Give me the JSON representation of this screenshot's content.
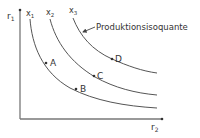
{
  "diagram": {
    "title": "Produktionsisoquante",
    "axes": {
      "y_label": "r",
      "y_sub": "1",
      "x_label": "r",
      "x_sub": "2"
    },
    "curves": [
      {
        "label": "x",
        "sub": "1"
      },
      {
        "label": "x",
        "sub": "2"
      },
      {
        "label": "x",
        "sub": "3"
      }
    ],
    "points": [
      {
        "label": "A",
        "curve": "x1"
      },
      {
        "label": "B",
        "curve": "x1"
      },
      {
        "label": "C",
        "curve": "x2"
      },
      {
        "label": "D",
        "curve": "x3"
      }
    ],
    "annotation": "Produktionsisoquante",
    "colors": {
      "axis": "#777777",
      "curve": "#555555",
      "text": "#333333"
    }
  }
}
